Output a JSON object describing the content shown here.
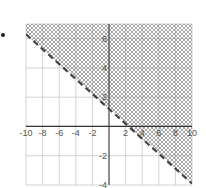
{
  "chart_data": {
    "type": "line",
    "title": "",
    "xlabel": "",
    "ylabel": "",
    "xlim": [
      -10,
      10
    ],
    "ylim": [
      -4,
      7
    ],
    "grid": true,
    "x_ticks": [
      "-10",
      "-8",
      "-6",
      "-4",
      "-2",
      "2",
      "4",
      "6",
      "8",
      "10"
    ],
    "y_ticks": [
      "6",
      "4",
      "2",
      "-2",
      "-4"
    ],
    "series": [
      {
        "name": "boundary",
        "style": "dashed",
        "x": [
          -10,
          10
        ],
        "y": [
          6.3,
          -3.9
        ]
      }
    ],
    "shaded_region": "above boundary line (cross-hatched)",
    "inequality_approx": "y > -0.5x + 1.5"
  },
  "colors": {
    "grid": "#c8c8c8",
    "axis": "#333333",
    "line": "#444444",
    "hatch": "#9a9a9a"
  },
  "marker": "bullet"
}
